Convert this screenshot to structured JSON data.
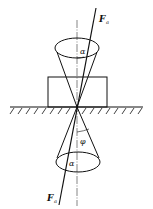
{
  "diagram": {
    "labels": {
      "force_top": "F",
      "force_top_sub": "a",
      "force_bottom": "F",
      "force_bottom_sub": "a",
      "alpha_top": "α",
      "alpha_bottom": "α",
      "phi": "φ"
    },
    "colors": {
      "line": "#111111",
      "background": "#ffffff"
    }
  }
}
